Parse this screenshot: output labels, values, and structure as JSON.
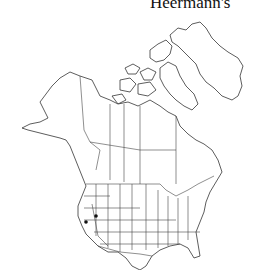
{
  "title": "Heermann's",
  "map": {
    "region": "North America",
    "style": "outline range map",
    "line_color": "#333333",
    "background": "#ffffff",
    "occurrence_points": [
      {
        "label": "California",
        "x": 86,
        "y": 222
      },
      {
        "label": "Nevada",
        "x": 96,
        "y": 216
      }
    ]
  }
}
